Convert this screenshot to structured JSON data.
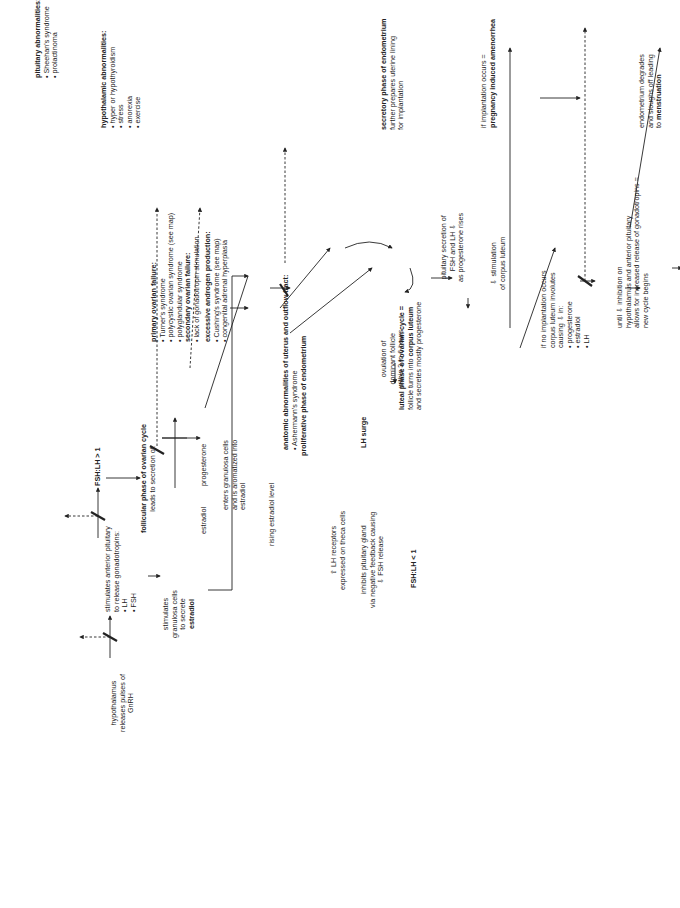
{
  "hypothalamic_abnormalities": {
    "title": "hypothalamic abnormalities:",
    "items": [
      "• hyper or hypothyroidism",
      "• stress",
      "• anorexia",
      "• exercise"
    ]
  },
  "pituitary_abnormalities": {
    "title": "pituitary abnormalities:",
    "items": [
      "• Sheehan's syndrome",
      "• prolactinoma"
    ]
  },
  "hypothalamus": {
    "lines": [
      "hypothalamus",
      "releases pulses of",
      "GnRH"
    ]
  },
  "stimulates_pituitary": {
    "lines": [
      "stimulates anterior pituitary",
      "to release gonadotropins:",
      "• LH",
      "• FSH"
    ]
  },
  "fsh_lh_gt": {
    "text": "FSH:LH > 1"
  },
  "granulosa": {
    "lines": [
      "stimulates",
      "granulosa cells",
      "to secrete"
    ],
    "bold": "estradiol"
  },
  "follicular_phase": {
    "title": "follicular phase of ovarian cycle",
    "sub": "leads to secretion of:"
  },
  "estradiol_label": {
    "text": "estradiol"
  },
  "progesterone_label": {
    "text": "progesterone"
  },
  "aromatized": {
    "lines": [
      "enters granulosa cells",
      "and is aromatized into",
      "estradiol"
    ]
  },
  "rising_estradiol": {
    "text": "rising estradiol level"
  },
  "primary_ovarian_failure": {
    "title": "primary ovarian failure:",
    "items": [
      "• Turner's syndrome",
      "• polycystic ovarian syndrome (see map)",
      "• polyglandular syndrome"
    ],
    "secondary_title": "secondary ovarian failure:",
    "secondary_items": [
      "• lack of gonadotropin stimulation"
    ]
  },
  "excessive_androgen": {
    "title": "excessive androgen production:",
    "items": [
      "• Cushing's syndrome (see map)",
      "• congenital adrenal hyperplasia"
    ]
  },
  "proliferative_phase": {
    "text": "proliferative phase of endometrium"
  },
  "anatomic_abnormalities": {
    "title": "anatomic abnormalities of uterus and outflow tract:",
    "items": [
      "• Ashermann's syndrome"
    ]
  },
  "lh_receptors": {
    "lines": [
      "⇧ LH receptors",
      "expressed on theca cells"
    ]
  },
  "inhibits_pituitary": {
    "lines": [
      "inhibits pituitary gland",
      "via negative feedback causing",
      "⇩ FSH release"
    ]
  },
  "fsh_lh_lt": {
    "text": "FSH:LH < 1"
  },
  "lh_surge": {
    "text": "LH surge"
  },
  "ovulation": {
    "lines": [
      "ovulation of",
      "dominant follicle",
      "within 3 to 6 hours"
    ]
  },
  "luteal_phase": {
    "title": "luteal phase of ovarian cycle =",
    "line2_pre": "follicle turns into ",
    "line2_bold": "corpus luteum",
    "line3": "and secretes mostly progesterone"
  },
  "pituitary_secretion": {
    "lines": [
      "pituitary secretion of",
      "FSH and LH ⇩",
      "as progesterone rises"
    ]
  },
  "stimulation_cl": {
    "lines": [
      "⇩ stimulation",
      "of corpus luteum"
    ]
  },
  "secretory_phase": {
    "title": "secretory phase of endometrium",
    "lines": [
      "further prepares uterine lining",
      "for implantation"
    ]
  },
  "implantation": {
    "line1": "if implantation occurs =",
    "bold": "pregnancy induced amenorrhea"
  },
  "no_implantation": {
    "lines": [
      "if no implantation occurs",
      "corpus luteum involutes",
      "causing ⇩ in:",
      "• progesterone",
      "• estradiol",
      "• LH"
    ]
  },
  "until_inhibition": {
    "lines": [
      "until ⇩ inhibition on",
      "hypothalamus and anterior pituitary",
      "allows for increased release of gonadotropins =",
      "new cycle begins"
    ]
  },
  "menstruation": {
    "lines": [
      "endometrium degrades",
      "and sloughs off leading"
    ],
    "pre": "to ",
    "bold": "menstruation"
  }
}
